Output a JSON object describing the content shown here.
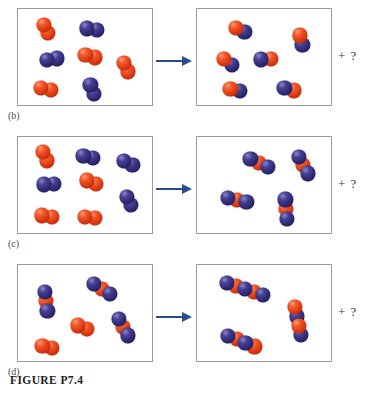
{
  "figure": {
    "caption": "FIGURE P7.4",
    "arrow_color": "#2a4b8d",
    "atom_colors": {
      "red": "#d8360f",
      "blue": "#2d2870"
    },
    "unknown_product_label": "+ ?"
  },
  "chart_data": {
    "type": "diagram",
    "title": "FIGURE P7.4",
    "subtype": "space-filling molecular reaction diagrams",
    "legend": {
      "red": "red atom (element A)",
      "blue": "blue atom (element B)"
    },
    "panels": [
      {
        "label": "(b)",
        "reactants": {
          "count": 7,
          "summary": "4 red diatomic (A2) + 3 blue diatomic (B2)",
          "molecules": [
            {
              "formula": "A2",
              "atoms": [
                "red",
                "red"
              ]
            },
            {
              "formula": "A2",
              "atoms": [
                "red",
                "red"
              ]
            },
            {
              "formula": "A2",
              "atoms": [
                "red",
                "red"
              ]
            },
            {
              "formula": "A2",
              "atoms": [
                "red",
                "red"
              ]
            },
            {
              "formula": "B2",
              "atoms": [
                "blue",
                "blue"
              ]
            },
            {
              "formula": "B2",
              "atoms": [
                "blue",
                "blue"
              ]
            },
            {
              "formula": "B2",
              "atoms": [
                "blue",
                "blue"
              ]
            }
          ]
        },
        "products": {
          "count": 6,
          "summary": "6 red-blue heterodiatomic (AB)",
          "molecules": [
            {
              "formula": "AB",
              "atoms": [
                "red",
                "blue"
              ]
            },
            {
              "formula": "AB",
              "atoms": [
                "red",
                "blue"
              ]
            },
            {
              "formula": "AB",
              "atoms": [
                "red",
                "blue"
              ]
            },
            {
              "formula": "AB",
              "atoms": [
                "red",
                "blue"
              ]
            },
            {
              "formula": "AB",
              "atoms": [
                "red",
                "blue"
              ]
            },
            {
              "formula": "AB",
              "atoms": [
                "red",
                "blue"
              ]
            }
          ]
        },
        "leftover": "+ ?"
      },
      {
        "label": "(c)",
        "reactants": {
          "count": 8,
          "summary": "4 red diatomic (A2) + 4 blue diatomic (B2)",
          "molecules": [
            {
              "formula": "A2",
              "atoms": [
                "red",
                "red"
              ]
            },
            {
              "formula": "A2",
              "atoms": [
                "red",
                "red"
              ]
            },
            {
              "formula": "A2",
              "atoms": [
                "red",
                "red"
              ]
            },
            {
              "formula": "A2",
              "atoms": [
                "red",
                "red"
              ]
            },
            {
              "formula": "B2",
              "atoms": [
                "blue",
                "blue"
              ]
            },
            {
              "formula": "B2",
              "atoms": [
                "blue",
                "blue"
              ]
            },
            {
              "formula": "B2",
              "atoms": [
                "blue",
                "blue"
              ]
            },
            {
              "formula": "B2",
              "atoms": [
                "blue",
                "blue"
              ]
            }
          ]
        },
        "products": {
          "count": 4,
          "summary": "4 triatomic blue-red-blue (BAB)",
          "molecules": [
            {
              "formula": "BAB",
              "atoms": [
                "blue",
                "red",
                "blue"
              ]
            },
            {
              "formula": "BAB",
              "atoms": [
                "blue",
                "red",
                "blue"
              ]
            },
            {
              "formula": "BAB",
              "atoms": [
                "blue",
                "red",
                "blue"
              ]
            },
            {
              "formula": "BAB",
              "atoms": [
                "blue",
                "red",
                "blue"
              ]
            }
          ]
        },
        "leftover": "+ ?"
      },
      {
        "label": "(d)",
        "reactants": {
          "count": 5,
          "summary": "3 triatomic blue-red-blue (BAB) + 2 red diatomic (A2)",
          "molecules": [
            {
              "formula": "BAB",
              "atoms": [
                "blue",
                "red",
                "blue"
              ]
            },
            {
              "formula": "BAB",
              "atoms": [
                "blue",
                "red",
                "blue"
              ]
            },
            {
              "formula": "BAB",
              "atoms": [
                "blue",
                "red",
                "blue"
              ]
            },
            {
              "formula": "A2",
              "atoms": [
                "red",
                "red"
              ]
            },
            {
              "formula": "A2",
              "atoms": [
                "red",
                "red"
              ]
            }
          ]
        },
        "products": {
          "count": 3,
          "summary": "3 pentatomic alternating blue-red-blue-red-blue",
          "molecules": [
            {
              "formula": "BABAB",
              "atoms": [
                "blue",
                "red",
                "blue",
                "red",
                "blue"
              ]
            },
            {
              "formula": "BABAB",
              "atoms": [
                "blue",
                "red",
                "blue",
                "red",
                "blue"
              ]
            },
            {
              "formula": "BABAB",
              "atoms": [
                "blue",
                "red",
                "blue",
                "red",
                "blue"
              ]
            }
          ]
        },
        "leftover": "+ ?"
      }
    ]
  },
  "layout": {
    "panels": {
      "b": {
        "left": [
          {
            "x": 28,
            "y": 20,
            "a": 62,
            "atoms": [
              "red",
              "red"
            ]
          },
          {
            "x": 74,
            "y": 20,
            "a": 8,
            "atoms": [
              "blue",
              "blue"
            ]
          },
          {
            "x": 34,
            "y": 50,
            "a": 352,
            "atoms": [
              "blue",
              "blue"
            ]
          },
          {
            "x": 72,
            "y": 47,
            "a": 18,
            "atoms": [
              "red",
              "red"
            ]
          },
          {
            "x": 108,
            "y": 58,
            "a": 66,
            "atoms": [
              "red",
              "red"
            ]
          },
          {
            "x": 28,
            "y": 80,
            "a": 10,
            "atoms": [
              "red",
              "red"
            ]
          },
          {
            "x": 74,
            "y": 80,
            "a": 70,
            "atoms": [
              "blue",
              "blue"
            ]
          }
        ],
        "right": [
          {
            "x": 43,
            "y": 21,
            "a": 22,
            "atoms": [
              "red",
              "blue"
            ]
          },
          {
            "x": 104,
            "y": 31,
            "a": 74,
            "atoms": [
              "red",
              "blue"
            ]
          },
          {
            "x": 31,
            "y": 53,
            "a": 38,
            "atoms": [
              "red",
              "blue"
            ]
          },
          {
            "x": 69,
            "y": 50,
            "a": 355,
            "atoms": [
              "blue",
              "red"
            ]
          },
          {
            "x": 38,
            "y": 81,
            "a": 14,
            "atoms": [
              "red",
              "blue"
            ]
          },
          {
            "x": 92,
            "y": 80,
            "a": 16,
            "atoms": [
              "blue",
              "red"
            ]
          }
        ]
      },
      "c": {
        "left": [
          {
            "x": 27,
            "y": 19,
            "a": 66,
            "atoms": [
              "red",
              "red"
            ]
          },
          {
            "x": 70,
            "y": 20,
            "a": 14,
            "atoms": [
              "blue",
              "blue"
            ]
          },
          {
            "x": 110,
            "y": 26,
            "a": 26,
            "atoms": [
              "blue",
              "blue"
            ]
          },
          {
            "x": 31,
            "y": 47,
            "a": 356,
            "atoms": [
              "blue",
              "blue"
            ]
          },
          {
            "x": 73,
            "y": 45,
            "a": 20,
            "atoms": [
              "red",
              "red"
            ]
          },
          {
            "x": 111,
            "y": 64,
            "a": 62,
            "atoms": [
              "blue",
              "blue"
            ]
          },
          {
            "x": 29,
            "y": 79,
            "a": 8,
            "atoms": [
              "red",
              "red"
            ]
          },
          {
            "x": 72,
            "y": 80,
            "a": 6,
            "atoms": [
              "red",
              "red"
            ]
          }
        ],
        "right": [
          {
            "x": 62,
            "y": 26,
            "a": 26,
            "atoms": [
              "blue",
              "red",
              "blue"
            ]
          },
          {
            "x": 106,
            "y": 28,
            "a": 62,
            "atoms": [
              "blue",
              "red",
              "blue"
            ]
          },
          {
            "x": 40,
            "y": 63,
            "a": 12,
            "atoms": [
              "blue",
              "red",
              "blue"
            ]
          },
          {
            "x": 89,
            "y": 72,
            "a": 86,
            "atoms": [
              "blue",
              "red",
              "blue"
            ]
          }
        ]
      },
      "d": {
        "left": [
          {
            "x": 28,
            "y": 36,
            "a": 82,
            "atoms": [
              "blue",
              "red",
              "blue"
            ]
          },
          {
            "x": 84,
            "y": 24,
            "a": 32,
            "atoms": [
              "blue",
              "red",
              "blue"
            ]
          },
          {
            "x": 105,
            "y": 62,
            "a": 62,
            "atoms": [
              "blue",
              "red",
              "blue"
            ]
          },
          {
            "x": 64,
            "y": 62,
            "a": 20,
            "atoms": [
              "red",
              "red"
            ]
          },
          {
            "x": 29,
            "y": 82,
            "a": 14,
            "atoms": [
              "red",
              "red"
            ]
          }
        ],
        "right": [
          {
            "x": 48,
            "y": 24,
            "a": 18,
            "atoms": [
              "blue",
              "red",
              "blue",
              "red",
              "blue"
            ]
          },
          {
            "x": 101,
            "y": 56,
            "a": 78,
            "atoms": [
              "red",
              "blue",
              "red",
              "blue"
            ]
          },
          {
            "x": 44,
            "y": 76,
            "a": 22,
            "atoms": [
              "blue",
              "red",
              "blue",
              "red"
            ]
          }
        ]
      }
    }
  }
}
